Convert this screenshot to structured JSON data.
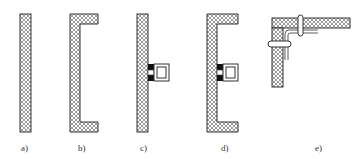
{
  "figure": {
    "panels": [
      {
        "id": "a",
        "label": "a)",
        "description": "single straight insulated panel"
      },
      {
        "id": "b",
        "label": "b)",
        "description": "C-shaped insulated panel"
      },
      {
        "id": "c",
        "label": "c)",
        "description": "straight panel with attached square bracket"
      },
      {
        "id": "d",
        "label": "d)",
        "description": "C-shaped panel with attached square bracket"
      },
      {
        "id": "e",
        "label": "e)",
        "description": "corner joint of two panels with bolts and L-bracket"
      }
    ],
    "colors": {
      "outline": "#333333",
      "hatch": "#555555",
      "solid_block": "#111111",
      "background": "#ffffff"
    }
  }
}
